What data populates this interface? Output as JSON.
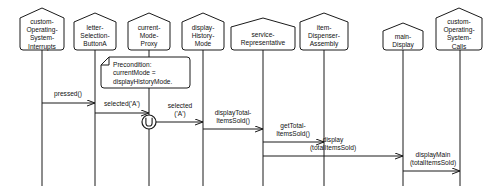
{
  "diagram": {
    "kind": "uml-sequence-diagram",
    "width": 484,
    "height": 191,
    "background_color": "#ffffff",
    "line_color": "#1a1a1a",
    "text_color": "#111111"
  },
  "lifelines": [
    {
      "id": "custom-operating-system-interrupts",
      "name_lines": [
        "custom-",
        "Operating-",
        "System-",
        "Interrupts"
      ],
      "x": 42,
      "box": {
        "left": 20,
        "top": 8,
        "width": 44,
        "height": 42,
        "notch": 10
      },
      "lifeline_bottom": 186
    },
    {
      "id": "letter-selection-buttona",
      "name_lines": [
        "letter-",
        "Selection-",
        "ButtonA"
      ],
      "x": 95,
      "box": {
        "left": 74,
        "top": 13,
        "width": 42,
        "height": 37,
        "notch": 9
      },
      "lifeline_bottom": 186
    },
    {
      "id": "current-mode-proxy",
      "name_lines": [
        "current-",
        "Mode-",
        "Proxy"
      ],
      "x": 149,
      "box": {
        "left": 128,
        "top": 13,
        "width": 42,
        "height": 37,
        "notch": 9
      },
      "lifeline_bottom": 186
    },
    {
      "id": "display-history-mode",
      "name_lines": [
        "display-",
        "History-",
        "Mode"
      ],
      "x": 203,
      "box": {
        "left": 182,
        "top": 13,
        "width": 42,
        "height": 37,
        "notch": 9
      },
      "lifeline_bottom": 186
    },
    {
      "id": "service-representative",
      "name_lines": [
        "service-",
        "Representative"
      ],
      "x": 263,
      "box": {
        "left": 231,
        "top": 18,
        "width": 64,
        "height": 32,
        "notch": 9
      },
      "lifeline_bottom": 186
    },
    {
      "id": "item-dispenser-assembly",
      "name_lines": [
        "item-",
        "Dispenser-",
        "Assembly"
      ],
      "x": 324,
      "box": {
        "left": 300,
        "top": 13,
        "width": 48,
        "height": 37,
        "notch": 9
      },
      "lifeline_bottom": 186
    },
    {
      "id": "main-display",
      "name_lines": [
        "main-",
        "Display"
      ],
      "x": 403,
      "box": {
        "left": 383,
        "top": 23,
        "width": 40,
        "height": 27,
        "notch": 8
      },
      "lifeline_bottom": 186
    },
    {
      "id": "custom-operating-system-calls",
      "name_lines": [
        "custom-",
        "Operating-",
        "System-",
        "Calls"
      ],
      "x": 460,
      "box": {
        "left": 436,
        "top": 8,
        "width": 46,
        "height": 42,
        "notch": 10
      },
      "lifeline_bottom": 186
    }
  ],
  "note": {
    "text_lines": [
      "Precondition:",
      "currentMode =",
      "displayHistoryMode."
    ],
    "box": {
      "left": 101,
      "top": 57,
      "width": 89,
      "height": 31
    },
    "fold_size": 8
  },
  "found_message_marker": {
    "label": "found-message-circle",
    "cx": 149,
    "cy": 122,
    "r": 7
  },
  "messages": [
    {
      "id": "pressed",
      "label_lines": [
        "pressed()"
      ],
      "from_x": 42,
      "to_x": 95,
      "y": 103,
      "label_x": 68,
      "label_y": 94,
      "direction": "right"
    },
    {
      "id": "selected-a-1",
      "label_lines": [
        "selected('A')"
      ],
      "from_x": 95,
      "to_x": 149,
      "y": 113,
      "label_x": 122,
      "label_y": 104,
      "direction": "right"
    },
    {
      "id": "selected-a-2",
      "label_lines": [
        "selected",
        "('A')"
      ],
      "from_x": 156,
      "to_x": 203,
      "y": 122,
      "label_x": 180,
      "label_y": 106,
      "direction": "right"
    },
    {
      "id": "display-total-items-sold",
      "label_lines": [
        "displayTotal-",
        "ItemsSold()"
      ],
      "from_x": 203,
      "to_x": 263,
      "y": 129,
      "label_x": 233,
      "label_y": 113,
      "direction": "right"
    },
    {
      "id": "get-total-items-sold",
      "label_lines": [
        "getTotal-",
        "ItemsSold()"
      ],
      "from_x": 263,
      "to_x": 324,
      "y": 142,
      "label_x": 293,
      "label_y": 126,
      "direction": "right"
    },
    {
      "id": "display-total-items-sold-main",
      "label_lines": [
        "display",
        "(totalItemsSold)"
      ],
      "from_x": 263,
      "to_x": 403,
      "y": 156,
      "label_x": 333,
      "label_y": 140,
      "direction": "right"
    },
    {
      "id": "display-main-total-items-sold",
      "label_lines": [
        "displayMain",
        "(totalItemsSold)"
      ],
      "from_x": 403,
      "to_x": 460,
      "y": 171,
      "label_x": 433,
      "label_y": 155,
      "direction": "right"
    }
  ]
}
